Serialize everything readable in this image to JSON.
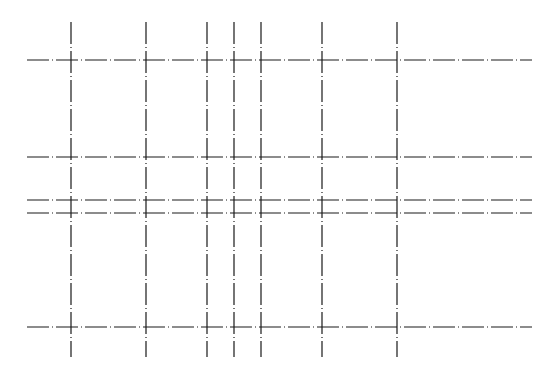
{
  "diagram": {
    "type": "dash-dot grid",
    "line_color": "#1a1a1a",
    "background": "#ffffff",
    "dash_pattern": "22,3,1,3",
    "vertical_lines": {
      "x": [
        71,
        146,
        207,
        234,
        261,
        322,
        397
      ],
      "y_start": 22,
      "y_end": 357
    },
    "horizontal_lines": {
      "y": [
        60,
        157,
        200,
        213,
        327
      ],
      "x_start": 27,
      "x_end": 532
    }
  }
}
